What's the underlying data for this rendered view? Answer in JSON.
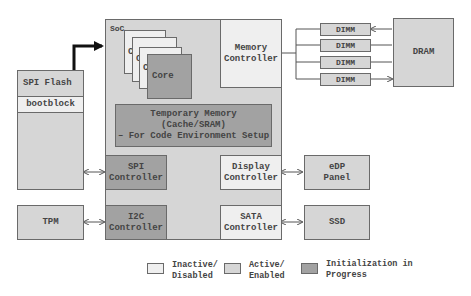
{
  "diagram": {
    "soc": {
      "label": "SoC"
    },
    "cores": {
      "stack_labels": [
        "C",
        "C",
        "C"
      ],
      "front_label": "Core"
    },
    "memory_controller": {
      "label": "Memory\nController"
    },
    "temp_memory": {
      "line1": "Temporary Memory (Cache/SRAM)",
      "line2": "– For Code Environment Setup"
    },
    "spi_flash": {
      "label": "SPI Flash",
      "bootblock": "bootblock"
    },
    "spi_controller": {
      "line1": "SPI",
      "line2": "Controller"
    },
    "i2c_controller": {
      "line1": "I2C",
      "line2": "Controller"
    },
    "display_controller": {
      "line1": "Display",
      "line2": "Controller"
    },
    "sata_controller": {
      "line1": "SATA",
      "line2": "Controller"
    },
    "tpm": {
      "label": "TPM"
    },
    "edp_panel": {
      "line1": "eDP",
      "line2": "Panel"
    },
    "ssd": {
      "label": "SSD"
    },
    "dimms": [
      "DIMM",
      "DIMM",
      "DIMM",
      "DIMM"
    ],
    "dram": {
      "label": "DRAM"
    }
  },
  "legend": {
    "items": [
      {
        "line1": "Inactive/",
        "line2": "Disabled",
        "color": "#efefef"
      },
      {
        "line1": "Active/",
        "line2": "Enabled",
        "color": "#d6d6d6"
      },
      {
        "line1": "Initialization in",
        "line2": "Progress",
        "color": "#a2a2a2"
      }
    ]
  }
}
